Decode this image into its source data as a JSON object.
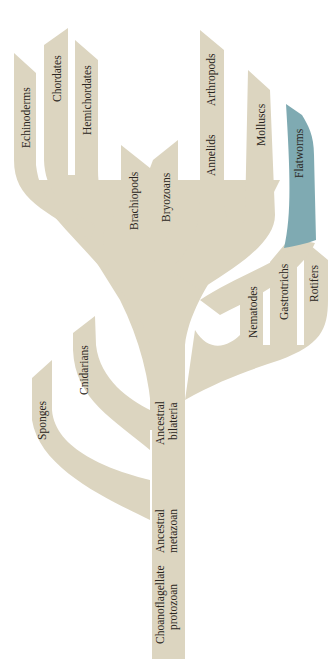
{
  "diagram": {
    "title": "",
    "type": "phylogenetic-tree",
    "colors": {
      "background": "#ffffff",
      "branch": "#dcd5c0",
      "highlight": "#7faab2",
      "text": "#2a2520"
    },
    "root": {
      "label_line1": "Choanoflagellate",
      "label_line2": "protozoan"
    },
    "nodes": {
      "metazoan": {
        "label_line1": "Ancestral",
        "label_line2": "metazoan"
      },
      "bilateria": {
        "label_line1": "Ancestral",
        "label_line2": "bilateria"
      }
    },
    "taxa": {
      "sponges": "Sponges",
      "cnidarians": "Cnidarians",
      "echinoderms": "Echinoderms",
      "chordates": "Chordates",
      "hemichordates": "Hemichordates",
      "brachiopods": "Brachiopods",
      "bryozoans": "Bryozoans",
      "annelids": "Annelids",
      "arthropods": "Arthropods",
      "molluscs": "Molluscs",
      "flatworms": "Flatworms",
      "nematodes": "Nematodes",
      "gastrotrichs": "Gastrotrichs",
      "rotifers": "Rotifers"
    },
    "highlighted_taxon": "Flatworms"
  }
}
